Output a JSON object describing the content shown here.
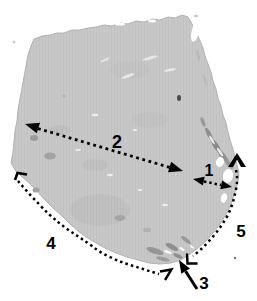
{
  "figure": {
    "labels": {
      "l1": "1",
      "l2": "2",
      "l3": "3",
      "l4": "4",
      "l5": "5"
    },
    "colors": {
      "background": "#ffffff",
      "tissue": "#c8c8c8",
      "tissue_edge": "#b2b2b2",
      "annotation": "#000000"
    }
  }
}
